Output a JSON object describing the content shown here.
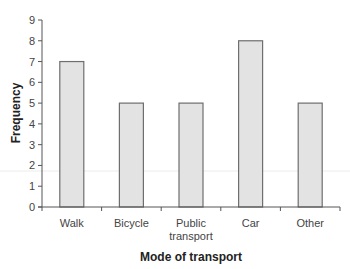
{
  "chart_data": {
    "type": "bar",
    "title": "",
    "xlabel": "Mode of transport",
    "ylabel": "Frequency",
    "categories": [
      "Walk",
      "Bicycle",
      "Public transport",
      "Car",
      "Other"
    ],
    "category_lines": [
      [
        "Walk"
      ],
      [
        "Bicycle"
      ],
      [
        "Public",
        "transport"
      ],
      [
        "Car"
      ],
      [
        "Other"
      ]
    ],
    "values": [
      7,
      5,
      5,
      8,
      5
    ],
    "ylim": [
      0,
      9
    ],
    "yticks": [
      0,
      1,
      2,
      3,
      4,
      5,
      6,
      7,
      8,
      9
    ],
    "grid": false,
    "legend": null,
    "bar_color": "#e3e3e3",
    "bar_edge_color": "#6e6e6e"
  }
}
